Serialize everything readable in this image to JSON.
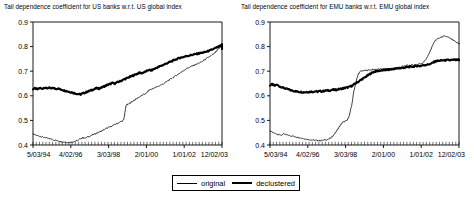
{
  "figure": {
    "width": 474,
    "height": 200,
    "background": "#ffffff",
    "line_color": "#000000"
  },
  "legend": {
    "position": "bottom-center",
    "entries": [
      {
        "label": "original",
        "style": "thin-line",
        "color": "#000000"
      },
      {
        "label": "declustered",
        "style": "thick-line",
        "color": "#000000"
      }
    ]
  },
  "chart_data": [
    {
      "type": "line",
      "panel": "left",
      "title": "Tail dependence coefficient for US banks w.r.t. US global index",
      "xlabel": "",
      "ylabel": "",
      "ylim": [
        0.4,
        0.9
      ],
      "yticks": [
        0.4,
        0.5,
        0.6,
        0.7,
        0.8,
        0.9
      ],
      "ytick_labels": [
        "0.4",
        "0.5",
        "0.6",
        "0.7",
        "0.8",
        "0.9"
      ],
      "xtick_labels": [
        "5/03/94",
        "4/02/96",
        "3/03/98",
        "2/01/00",
        "1/01/02",
        "12/02/03"
      ],
      "xtick_positions": [
        0,
        0.2,
        0.4,
        0.6,
        0.8,
        1.0
      ],
      "grid": false,
      "legend_position": "below-figure",
      "series": [
        {
          "name": "declustered",
          "style": "thick-line",
          "color": "#000000",
          "x": [
            0.0,
            0.012,
            0.024,
            0.036,
            0.048,
            0.06,
            0.072,
            0.084,
            0.096,
            0.108,
            0.12,
            0.132,
            0.144,
            0.156,
            0.168,
            0.18,
            0.192,
            0.204,
            0.216,
            0.228,
            0.24,
            0.252,
            0.264,
            0.276,
            0.288,
            0.3,
            0.312,
            0.324,
            0.336,
            0.348,
            0.36,
            0.372,
            0.384,
            0.396,
            0.408,
            0.42,
            0.432,
            0.444,
            0.456,
            0.468,
            0.48,
            0.492,
            0.504,
            0.516,
            0.528,
            0.54,
            0.552,
            0.564,
            0.576,
            0.588,
            0.6,
            0.612,
            0.624,
            0.636,
            0.648,
            0.66,
            0.672,
            0.684,
            0.696,
            0.708,
            0.72,
            0.732,
            0.744,
            0.756,
            0.768,
            0.78,
            0.792,
            0.804,
            0.816,
            0.828,
            0.84,
            0.852,
            0.864,
            0.876,
            0.888,
            0.9,
            0.912,
            0.924,
            0.936,
            0.948,
            0.96,
            0.972,
            0.984,
            0.996,
            1.0
          ],
          "values": [
            0.628,
            0.63,
            0.626,
            0.632,
            0.628,
            0.634,
            0.63,
            0.633,
            0.629,
            0.632,
            0.628,
            0.63,
            0.626,
            0.624,
            0.621,
            0.619,
            0.616,
            0.614,
            0.611,
            0.609,
            0.607,
            0.606,
            0.61,
            0.613,
            0.617,
            0.62,
            0.624,
            0.627,
            0.631,
            0.629,
            0.633,
            0.637,
            0.641,
            0.645,
            0.648,
            0.652,
            0.65,
            0.654,
            0.658,
            0.662,
            0.666,
            0.67,
            0.674,
            0.678,
            0.682,
            0.686,
            0.69,
            0.694,
            0.692,
            0.696,
            0.7,
            0.705,
            0.703,
            0.707,
            0.712,
            0.716,
            0.72,
            0.724,
            0.728,
            0.732,
            0.736,
            0.74,
            0.744,
            0.748,
            0.752,
            0.755,
            0.757,
            0.76,
            0.762,
            0.764,
            0.766,
            0.768,
            0.77,
            0.772,
            0.774,
            0.776,
            0.778,
            0.781,
            0.784,
            0.788,
            0.792,
            0.796,
            0.8,
            0.805,
            0.808
          ]
        },
        {
          "name": "original",
          "style": "thin-line",
          "color": "#000000",
          "x": [
            0.0,
            0.012,
            0.024,
            0.036,
            0.048,
            0.06,
            0.072,
            0.084,
            0.096,
            0.108,
            0.12,
            0.132,
            0.144,
            0.156,
            0.168,
            0.18,
            0.192,
            0.204,
            0.216,
            0.228,
            0.24,
            0.252,
            0.264,
            0.276,
            0.288,
            0.3,
            0.312,
            0.324,
            0.336,
            0.348,
            0.36,
            0.372,
            0.384,
            0.396,
            0.408,
            0.42,
            0.432,
            0.444,
            0.456,
            0.468,
            0.48,
            0.492,
            0.504,
            0.516,
            0.528,
            0.54,
            0.552,
            0.564,
            0.576,
            0.588,
            0.6,
            0.612,
            0.624,
            0.636,
            0.648,
            0.66,
            0.672,
            0.684,
            0.696,
            0.708,
            0.72,
            0.732,
            0.744,
            0.756,
            0.768,
            0.78,
            0.792,
            0.804,
            0.816,
            0.828,
            0.84,
            0.852,
            0.864,
            0.876,
            0.888,
            0.9,
            0.912,
            0.924,
            0.936,
            0.948,
            0.96,
            0.972,
            0.984,
            0.996,
            1.0
          ],
          "values": [
            0.443,
            0.441,
            0.438,
            0.436,
            0.433,
            0.431,
            0.428,
            0.426,
            0.424,
            0.421,
            0.419,
            0.417,
            0.415,
            0.413,
            0.412,
            0.411,
            0.41,
            0.412,
            0.414,
            0.416,
            0.419,
            0.426,
            0.43,
            0.428,
            0.432,
            0.436,
            0.44,
            0.444,
            0.448,
            0.452,
            0.456,
            0.461,
            0.466,
            0.47,
            0.474,
            0.478,
            0.483,
            0.487,
            0.492,
            0.496,
            0.501,
            0.56,
            0.566,
            0.572,
            0.578,
            0.584,
            0.59,
            0.596,
            0.601,
            0.606,
            0.61,
            0.622,
            0.626,
            0.63,
            0.634,
            0.638,
            0.642,
            0.646,
            0.652,
            0.658,
            0.664,
            0.67,
            0.676,
            0.682,
            0.688,
            0.694,
            0.7,
            0.706,
            0.712,
            0.716,
            0.72,
            0.724,
            0.728,
            0.732,
            0.736,
            0.742,
            0.748,
            0.754,
            0.76,
            0.766,
            0.772,
            0.782,
            0.792,
            0.802,
            0.806
          ]
        }
      ],
      "series_tail": {
        "note": "both series converge and decline slightly after the 2002 peak",
        "declustered_end": 0.79,
        "original_end": 0.788
      }
    },
    {
      "type": "line",
      "panel": "right",
      "title": "Tail dependence coefficient for EMU banks w.r.t. EMU global index",
      "xlabel": "",
      "ylabel": "",
      "ylim": [
        0.4,
        0.9
      ],
      "yticks": [
        0.4,
        0.5,
        0.6,
        0.7,
        0.8,
        0.9
      ],
      "ytick_labels": [
        "0.4",
        "0.5",
        "0.6",
        "0.7",
        "0.8",
        "0.9"
      ],
      "xtick_labels": [
        "5/03/94",
        "4/02/96",
        "3/03/98",
        "2/01/00",
        "1/01/02",
        "12/02/03"
      ],
      "xtick_positions": [
        0,
        0.2,
        0.4,
        0.6,
        0.8,
        1.0
      ],
      "grid": false,
      "legend_position": "below-figure",
      "series": [
        {
          "name": "declustered",
          "style": "thick-line",
          "color": "#000000",
          "x": [
            0.0,
            0.012,
            0.024,
            0.036,
            0.048,
            0.06,
            0.072,
            0.084,
            0.096,
            0.108,
            0.12,
            0.132,
            0.144,
            0.156,
            0.168,
            0.18,
            0.192,
            0.204,
            0.216,
            0.228,
            0.24,
            0.252,
            0.264,
            0.276,
            0.288,
            0.3,
            0.312,
            0.324,
            0.336,
            0.348,
            0.36,
            0.372,
            0.384,
            0.396,
            0.408,
            0.42,
            0.432,
            0.444,
            0.456,
            0.468,
            0.48,
            0.492,
            0.504,
            0.516,
            0.528,
            0.54,
            0.552,
            0.564,
            0.576,
            0.588,
            0.6,
            0.612,
            0.624,
            0.636,
            0.648,
            0.66,
            0.672,
            0.684,
            0.696,
            0.708,
            0.72,
            0.732,
            0.744,
            0.756,
            0.768,
            0.78,
            0.792,
            0.804,
            0.816,
            0.828,
            0.84,
            0.852,
            0.864,
            0.876,
            0.888,
            0.9,
            0.912,
            0.924,
            0.936,
            0.948,
            0.96,
            0.972,
            0.984,
            0.996,
            1.0
          ],
          "values": [
            0.643,
            0.647,
            0.641,
            0.645,
            0.639,
            0.636,
            0.632,
            0.629,
            0.626,
            0.623,
            0.621,
            0.619,
            0.617,
            0.616,
            0.615,
            0.614,
            0.616,
            0.615,
            0.617,
            0.616,
            0.618,
            0.617,
            0.619,
            0.618,
            0.62,
            0.622,
            0.621,
            0.623,
            0.625,
            0.624,
            0.626,
            0.628,
            0.63,
            0.632,
            0.634,
            0.636,
            0.64,
            0.646,
            0.652,
            0.658,
            0.664,
            0.67,
            0.676,
            0.682,
            0.688,
            0.694,
            0.698,
            0.7,
            0.702,
            0.703,
            0.704,
            0.705,
            0.706,
            0.707,
            0.708,
            0.71,
            0.711,
            0.712,
            0.713,
            0.714,
            0.716,
            0.717,
            0.718,
            0.719,
            0.72,
            0.722,
            0.721,
            0.723,
            0.725,
            0.726,
            0.728,
            0.73,
            0.736,
            0.74,
            0.742,
            0.743,
            0.744,
            0.744,
            0.745,
            0.745,
            0.745,
            0.746,
            0.746,
            0.746,
            0.746
          ]
        },
        {
          "name": "original",
          "style": "thin-line",
          "color": "#000000",
          "x": [
            0.0,
            0.012,
            0.024,
            0.036,
            0.048,
            0.06,
            0.072,
            0.084,
            0.096,
            0.108,
            0.12,
            0.132,
            0.144,
            0.156,
            0.168,
            0.18,
            0.192,
            0.204,
            0.216,
            0.228,
            0.24,
            0.252,
            0.264,
            0.276,
            0.288,
            0.3,
            0.312,
            0.324,
            0.336,
            0.348,
            0.36,
            0.372,
            0.384,
            0.396,
            0.408,
            0.42,
            0.432,
            0.444,
            0.456,
            0.468,
            0.48,
            0.492,
            0.504,
            0.516,
            0.528,
            0.54,
            0.552,
            0.564,
            0.576,
            0.588,
            0.6,
            0.612,
            0.624,
            0.636,
            0.648,
            0.66,
            0.672,
            0.684,
            0.696,
            0.708,
            0.72,
            0.732,
            0.744,
            0.756,
            0.768,
            0.78,
            0.792,
            0.804,
            0.816,
            0.828,
            0.84,
            0.852,
            0.864,
            0.876,
            0.888,
            0.9,
            0.912,
            0.924,
            0.936,
            0.948,
            0.96,
            0.972,
            0.984,
            0.996,
            1.0
          ],
          "values": [
            0.455,
            0.452,
            0.448,
            0.445,
            0.442,
            0.44,
            0.444,
            0.442,
            0.44,
            0.438,
            0.436,
            0.434,
            0.432,
            0.43,
            0.428,
            0.426,
            0.424,
            0.422,
            0.421,
            0.42,
            0.419,
            0.418,
            0.418,
            0.419,
            0.42,
            0.422,
            0.424,
            0.43,
            0.44,
            0.452,
            0.466,
            0.48,
            0.492,
            0.496,
            0.5,
            0.52,
            0.56,
            0.62,
            0.66,
            0.69,
            0.7,
            0.702,
            0.703,
            0.704,
            0.705,
            0.706,
            0.707,
            0.708,
            0.708,
            0.709,
            0.709,
            0.71,
            0.71,
            0.711,
            0.712,
            0.713,
            0.714,
            0.716,
            0.718,
            0.72,
            0.722,
            0.724,
            0.725,
            0.726,
            0.727,
            0.728,
            0.73,
            0.732,
            0.74,
            0.752,
            0.768,
            0.79,
            0.812,
            0.826,
            0.832,
            0.836,
            0.84,
            0.842,
            0.84,
            0.836,
            0.83,
            0.824,
            0.818,
            0.814,
            0.812
          ]
        }
      ],
      "series_tail": {
        "note": "original rises above declustered in 2003; declustered stays flat near 0.74",
        "declustered_end": 0.745,
        "original_end": 0.812
      }
    }
  ]
}
